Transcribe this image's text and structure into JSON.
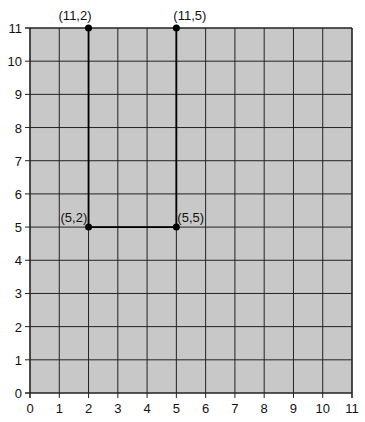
{
  "chart_data": {
    "type": "line",
    "title": "",
    "xlabel": "",
    "ylabel": "",
    "xlim": [
      0,
      11
    ],
    "ylim": [
      0,
      11
    ],
    "grid": true,
    "x_ticks": [
      "0",
      "1",
      "2",
      "3",
      "4",
      "5",
      "6",
      "7",
      "8",
      "9",
      "10",
      "11"
    ],
    "y_ticks": [
      "0",
      "1",
      "2",
      "3",
      "4",
      "5",
      "6",
      "7",
      "8",
      "9",
      "10",
      "11"
    ],
    "series": [
      {
        "name": "path",
        "points": [
          {
            "x": 2,
            "y": 11,
            "label": "(11,2)"
          },
          {
            "x": 2,
            "y": 5,
            "label": "(5,2)"
          },
          {
            "x": 5,
            "y": 5,
            "label": "(5,5)"
          },
          {
            "x": 5,
            "y": 11,
            "label": "(11,5)"
          }
        ]
      }
    ],
    "colors": {
      "plot_bg": "#c8c8c8",
      "grid": "#222222",
      "line": "#000000"
    }
  }
}
